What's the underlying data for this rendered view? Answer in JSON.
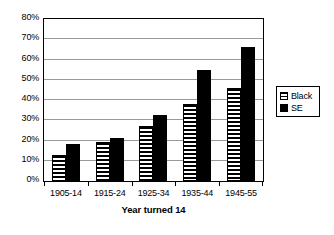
{
  "chart_data": {
    "type": "bar",
    "title": "",
    "subtitle": "",
    "xlabel": "Year turned 14",
    "ylabel": "",
    "categories": [
      "1905-14",
      "1915-24",
      "1925-34",
      "1935-44",
      "1945-55"
    ],
    "series": [
      {
        "name": "Black",
        "values": [
          13,
          19.5,
          27,
          38,
          46
        ]
      },
      {
        "name": "SE",
        "values": [
          18.5,
          21,
          32.5,
          55,
          66
        ]
      }
    ],
    "ylim": [
      0,
      80
    ],
    "ytick_labels": [
      "0%",
      "10%",
      "20%",
      "30%",
      "40%",
      "50%",
      "60%",
      "70%",
      "80%"
    ],
    "ytick_values": [
      0,
      10,
      20,
      30,
      40,
      50,
      60,
      70,
      80
    ],
    "grid": true,
    "legend_position": "right",
    "legend": [
      {
        "label": "Black",
        "swatch": "horizontal-stripe-pattern"
      },
      {
        "label": "SE",
        "swatch": "solid-black"
      }
    ],
    "colors": {
      "series_black": "#ffffff",
      "series_black_pattern": "#000000",
      "series_se": "#000000",
      "gridline": "#9a9a9a",
      "axis": "#000000",
      "background": "#ffffff"
    }
  }
}
